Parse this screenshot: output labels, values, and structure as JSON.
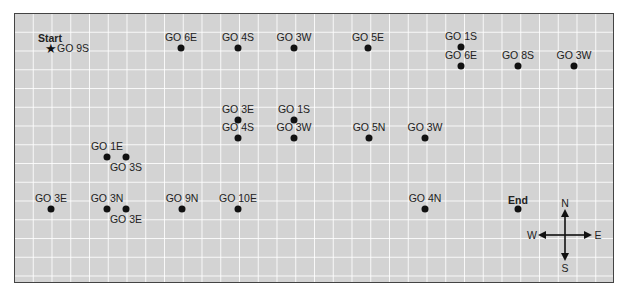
{
  "map": {
    "grid": {
      "cell_px": 18.75,
      "background": "#d3d3d3",
      "line_color": "#ffffff",
      "border_color": "#444444"
    },
    "start": {
      "title": "Start",
      "label": "GO 9S",
      "icon": "star-icon",
      "x": 50,
      "y": 48
    },
    "end": {
      "label": "End",
      "x": 518,
      "y": 209
    },
    "waypoints": [
      {
        "label": "GO 6E",
        "x": 181,
        "y": 48,
        "label_pos": "above"
      },
      {
        "label": "GO 4S",
        "x": 238,
        "y": 48,
        "label_pos": "above"
      },
      {
        "label": "GO 3W",
        "x": 294,
        "y": 48,
        "label_pos": "above"
      },
      {
        "label": "GO 5E",
        "x": 368,
        "y": 48,
        "label_pos": "above"
      },
      {
        "label": "GO 1S",
        "x": 461,
        "y": 47,
        "label_pos": "above"
      },
      {
        "label": "GO 6E",
        "x": 461,
        "y": 66,
        "label_pos": "above"
      },
      {
        "label": "GO 8S",
        "x": 518,
        "y": 66,
        "label_pos": "above"
      },
      {
        "label": "GO 3W",
        "x": 574,
        "y": 66,
        "label_pos": "above"
      },
      {
        "label": "GO 3E",
        "x": 238,
        "y": 120,
        "label_pos": "above"
      },
      {
        "label": "GO 1S",
        "x": 294,
        "y": 120,
        "label_pos": "above"
      },
      {
        "label": "GO 4S",
        "x": 238,
        "y": 138,
        "label_pos": "above"
      },
      {
        "label": "GO 3W",
        "x": 294,
        "y": 138,
        "label_pos": "above"
      },
      {
        "label": "GO 5N",
        "x": 369,
        "y": 138,
        "label_pos": "above"
      },
      {
        "label": "GO 3W",
        "x": 425,
        "y": 138,
        "label_pos": "above"
      },
      {
        "label": "GO 1E",
        "x": 107,
        "y": 157,
        "label_pos": "above"
      },
      {
        "label": "GO 3S",
        "x": 126,
        "y": 157,
        "label_pos": "below"
      },
      {
        "label": "GO 3E",
        "x": 51,
        "y": 209,
        "label_pos": "above"
      },
      {
        "label": "GO 3N",
        "x": 107,
        "y": 209,
        "label_pos": "above"
      },
      {
        "label": "GO 3E",
        "x": 126,
        "y": 209,
        "label_pos": "below"
      },
      {
        "label": "GO 9N",
        "x": 182,
        "y": 209,
        "label_pos": "above"
      },
      {
        "label": "GO 10E",
        "x": 238,
        "y": 209,
        "label_pos": "above"
      },
      {
        "label": "GO 4N",
        "x": 425,
        "y": 209,
        "label_pos": "above"
      }
    ],
    "compass": {
      "n": "N",
      "s": "S",
      "e": "E",
      "w": "W",
      "cx": 565,
      "cy": 235
    }
  }
}
